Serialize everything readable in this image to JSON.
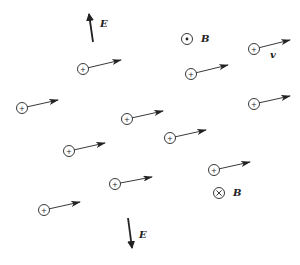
{
  "diagram": {
    "colors": {
      "ink": "#222222",
      "background": "#ffffff"
    },
    "field_labels": {
      "e_top": "E",
      "e_bottom": "E",
      "b_out": "B",
      "b_in": "B",
      "velocity": "v"
    },
    "e_arrows": [
      {
        "name": "e-field-arrow-up",
        "x1": 93,
        "y1": 42,
        "x2": 89,
        "y2": 14,
        "label_x": 100,
        "label_y": 27,
        "label_key": "e_top"
      },
      {
        "name": "e-field-arrow-down",
        "x1": 128,
        "y1": 218,
        "x2": 132,
        "y2": 248,
        "label_x": 139,
        "label_y": 238,
        "label_key": "e_bottom"
      }
    ],
    "b_symbols": [
      {
        "name": "b-field-out-of-page-icon",
        "type": "dot",
        "cx": 187,
        "cy": 39,
        "label_x": 201,
        "label_y": 42,
        "label_key": "b_out"
      },
      {
        "name": "b-field-into-page-icon",
        "type": "cross",
        "cx": 219,
        "cy": 193,
        "label_x": 233,
        "label_y": 196,
        "label_key": "b_in"
      }
    ],
    "charge_symbol": "+",
    "particles": [
      {
        "cx": 83,
        "cy": 69,
        "ax": 121,
        "ay": 60
      },
      {
        "cx": 191,
        "cy": 74,
        "ax": 228,
        "ay": 65
      },
      {
        "cx": 254,
        "cy": 49,
        "ax": 290,
        "ay": 40
      },
      {
        "cx": 22,
        "cy": 108,
        "ax": 58,
        "ay": 100
      },
      {
        "cx": 127,
        "cy": 119,
        "ax": 163,
        "ay": 111
      },
      {
        "cx": 254,
        "cy": 104,
        "ax": 290,
        "ay": 96
      },
      {
        "cx": 69,
        "cy": 151,
        "ax": 105,
        "ay": 143
      },
      {
        "cx": 170,
        "cy": 138,
        "ax": 206,
        "ay": 130
      },
      {
        "cx": 214,
        "cy": 170,
        "ax": 250,
        "ay": 162
      },
      {
        "cx": 115,
        "cy": 184,
        "ax": 152,
        "ay": 177
      },
      {
        "cx": 44,
        "cy": 210,
        "ax": 80,
        "ay": 202
      }
    ],
    "velocity_label_pos": {
      "x": 270,
      "y": 58
    }
  }
}
